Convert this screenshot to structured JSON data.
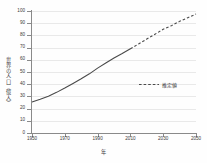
{
  "chart_data": {
    "type": "line",
    "title": "",
    "xlabel": "年",
    "ylabel": "世界の人口（億人）",
    "xlim": [
      1950,
      2050
    ],
    "ylim": [
      0,
      100
    ],
    "grid": true,
    "legend_position": "inside-right",
    "x_ticks": [
      1950,
      1970,
      1990,
      2010,
      2030,
      2050
    ],
    "y_ticks": [
      0,
      10,
      20,
      30,
      40,
      50,
      60,
      70,
      80,
      90,
      100
    ],
    "line_color": "#4a4a4a",
    "grid_color": "#e9e9e9",
    "axis_color": "#8a8a8a",
    "series": [
      {
        "name": "実績値",
        "style": "solid",
        "x": [
          1950,
          1955,
          1960,
          1965,
          1970,
          1975,
          1980,
          1985,
          1990,
          1995,
          2000,
          2005,
          2010
        ],
        "values": [
          25.4,
          27.7,
          30.2,
          33.3,
          36.8,
          40.6,
          44.4,
          48.5,
          53.2,
          57.4,
          61.4,
          65.1,
          69.0
        ]
      },
      {
        "name": "推定値",
        "style": "dashed",
        "x": [
          2010,
          2015,
          2020,
          2025,
          2030,
          2035,
          2040,
          2045,
          2050
        ],
        "values": [
          69.0,
          73.0,
          77.0,
          81.0,
          85.0,
          88.0,
          91.5,
          94.5,
          97.5
        ]
      }
    ]
  },
  "legend": {
    "estimate_label": "推定値"
  },
  "axes": {
    "y_title": "世界の人口（億人）",
    "x_title": "年"
  }
}
